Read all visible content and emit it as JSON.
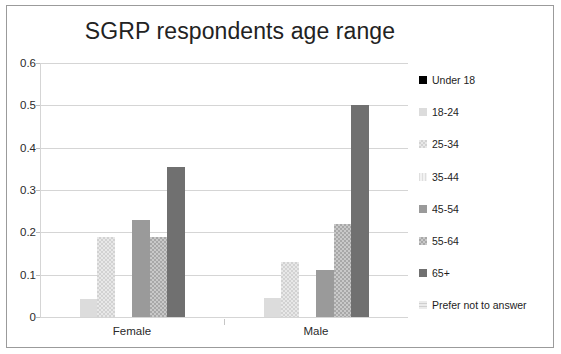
{
  "chart_data": {
    "type": "bar",
    "title": "SGRP respondents age range",
    "xlabel": "",
    "ylabel": "",
    "categories": [
      "Female",
      "Male"
    ],
    "ylim": [
      0,
      0.6
    ],
    "ytick_labels": [
      "0.6",
      "0.5",
      "0.4",
      "0.3",
      "0.2",
      "0.1",
      "0"
    ],
    "ytick_values": [
      0.6,
      0.5,
      0.4,
      0.3,
      0.2,
      0.1,
      0
    ],
    "grid": true,
    "legend_position": "right",
    "series": [
      {
        "name": "Under 18",
        "values": [
          0,
          0
        ],
        "color": "#000000",
        "pattern": "solid"
      },
      {
        "name": "18-24",
        "values": [
          0.042,
          0.044
        ],
        "color": "#dcdcdc",
        "pattern": "solid"
      },
      {
        "name": "25-34",
        "values": [
          0.189,
          0.131
        ],
        "color": "#e8e8e8",
        "pattern": "checker-light"
      },
      {
        "name": "35-44",
        "values": [
          0,
          0
        ],
        "color": "#f2f2f2",
        "pattern": "vertical-lines"
      },
      {
        "name": "45-54",
        "values": [
          0.228,
          0.111
        ],
        "color": "#9a9a9a",
        "pattern": "solid"
      },
      {
        "name": "55-64",
        "values": [
          0.188,
          0.219
        ],
        "color": "#c9c9c9",
        "pattern": "checker-grey"
      },
      {
        "name": "65+",
        "values": [
          0.355,
          0.502
        ],
        "color": "#707070",
        "pattern": "solid"
      },
      {
        "name": "Prefer not to answer",
        "values": [
          0,
          0
        ],
        "color": "#ebebeb",
        "pattern": "horizontal-lines"
      }
    ]
  },
  "legend": {
    "items": [
      {
        "label": "Under 18"
      },
      {
        "label": "18-24"
      },
      {
        "label": "25-34"
      },
      {
        "label": "35-44"
      },
      {
        "label": "45-54"
      },
      {
        "label": "55-64"
      },
      {
        "label": "65+"
      },
      {
        "label": "Prefer not to answer"
      }
    ]
  }
}
